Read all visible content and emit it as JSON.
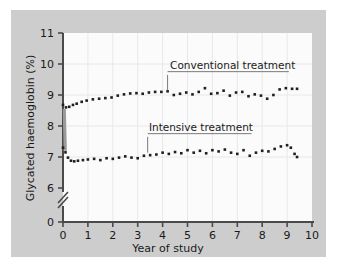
{
  "figure": {
    "background_color": "#ffffff",
    "panel_color": "#cdcdcd",
    "plot_background_color": "#fbfbfb",
    "axis_color": "#4a4a4a",
    "gridline_color": "#e8e8e8",
    "marker_color": "#1f1f1f",
    "transition_bar_color": "#9a9a9a"
  },
  "chart_data": {
    "type": "scatter",
    "title": "",
    "subtitle": "",
    "xlabel": "Year of study",
    "ylabel": "Glycated haemoglobin (%)",
    "xlim": [
      0,
      10
    ],
    "ylim": [
      6,
      11
    ],
    "y_axis_break": true,
    "y_break_from": 0,
    "y_break_to": 6,
    "xticks": [
      0,
      1,
      2,
      3,
      4,
      5,
      6,
      7,
      8,
      9,
      10
    ],
    "xticklabels": [
      "0",
      "1",
      "2",
      "3",
      "4",
      "5",
      "6",
      "7",
      "8",
      "9",
      "10"
    ],
    "yticks": [
      0,
      6,
      7,
      8,
      9,
      10,
      11
    ],
    "yticklabels": [
      "0",
      "6",
      "7",
      "8",
      "9",
      "10",
      "11"
    ],
    "grid": "vertical-and-horizontal-faint",
    "legend_position": "inline-annotations",
    "series": [
      {
        "name": "Conventional treatment",
        "label_x": 4.3,
        "label_y": 9.85,
        "leader_from_x": 4.2,
        "leader_from_y": 9.65,
        "leader_to_y": 9.15,
        "x": [
          0.0,
          0.12,
          0.25,
          0.4,
          0.55,
          0.75,
          0.95,
          1.2,
          1.45,
          1.7,
          1.95,
          2.2,
          2.45,
          2.7,
          2.95,
          3.2,
          3.45,
          3.7,
          3.95,
          4.2,
          4.45,
          4.7,
          4.95,
          5.2,
          5.45,
          5.7,
          5.95,
          6.2,
          6.45,
          6.7,
          6.95,
          7.2,
          7.45,
          7.7,
          7.95,
          8.2,
          8.45,
          8.7,
          8.95,
          9.2,
          9.4
        ],
        "y": [
          8.68,
          8.6,
          8.62,
          8.68,
          8.72,
          8.78,
          8.82,
          8.86,
          8.88,
          8.9,
          8.92,
          8.98,
          9.02,
          9.05,
          9.06,
          9.04,
          9.08,
          9.1,
          9.1,
          9.12,
          9.0,
          9.04,
          9.08,
          9.02,
          9.1,
          9.22,
          9.04,
          9.06,
          9.14,
          8.98,
          9.08,
          9.1,
          8.96,
          9.02,
          8.98,
          8.88,
          9.0,
          9.18,
          9.22,
          9.2,
          9.2
        ]
      },
      {
        "name": "Intensive treatment",
        "label_x": 3.45,
        "label_y": 7.85,
        "leader_from_x": 3.4,
        "leader_from_y": 7.65,
        "leader_to_y": 7.14,
        "x": [
          0.0,
          0.1,
          0.2,
          0.32,
          0.45,
          0.6,
          0.8,
          1.0,
          1.25,
          1.5,
          1.75,
          2.0,
          2.25,
          2.5,
          2.75,
          3.0,
          3.25,
          3.5,
          3.75,
          4.0,
          4.25,
          4.5,
          4.75,
          5.0,
          5.25,
          5.5,
          5.75,
          6.0,
          6.25,
          6.5,
          6.75,
          7.0,
          7.25,
          7.5,
          7.75,
          8.0,
          8.25,
          8.5,
          8.75,
          9.0,
          9.15,
          9.3,
          9.4
        ],
        "y": [
          7.3,
          7.15,
          6.98,
          6.88,
          6.86,
          6.88,
          6.9,
          6.92,
          6.94,
          6.9,
          6.96,
          6.94,
          6.98,
          7.02,
          6.98,
          6.96,
          7.04,
          7.06,
          7.08,
          7.14,
          7.1,
          7.16,
          7.12,
          7.22,
          7.14,
          7.2,
          7.12,
          7.22,
          7.18,
          7.24,
          7.14,
          7.1,
          7.22,
          7.04,
          7.14,
          7.2,
          7.18,
          7.26,
          7.34,
          7.38,
          7.3,
          7.1,
          7.0
        ]
      }
    ],
    "transition_bar": {
      "x": 0.05,
      "y_top": 8.55,
      "y_bottom": 7.2,
      "description": "thick grey vertical connector at baseline where groups diverge"
    }
  }
}
